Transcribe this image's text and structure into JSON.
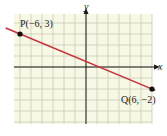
{
  "chart_data": {
    "type": "line",
    "title": "",
    "xlabel": "x",
    "ylabel": "y",
    "xlim": [
      -6.5,
      6
    ],
    "ylim": [
      -5,
      5
    ],
    "grid": true,
    "series": [
      {
        "name": "line PQ",
        "color": "#c8323c",
        "points": [
          {
            "label": "P(−6, 3)",
            "x": -6,
            "y": 3
          },
          {
            "label": "Q(6, −2)",
            "x": 6,
            "y": -2
          }
        ]
      }
    ]
  },
  "labels": {
    "x_axis": "x",
    "y_axis": "y",
    "point_p": "P(−6, 3)",
    "point_q": "Q(6, −2)"
  },
  "colors": {
    "background": "#f8f8e6",
    "grid": "#c9cbb4",
    "axis": "#1a1a1a",
    "line": "#c8323c",
    "point": "#111111"
  }
}
